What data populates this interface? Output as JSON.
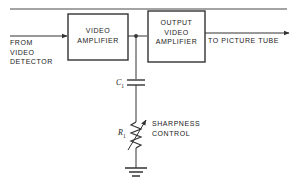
{
  "diagram": {
    "colors": {
      "line": "#333333",
      "text": "#1a1a1a",
      "background": "#ffffff"
    },
    "blocks": [
      {
        "id": "video-amplifier",
        "label": "VIDEO\nAMPLIFIER"
      },
      {
        "id": "output-video-amplifier",
        "label": "OUTPUT\nVIDEO\nAMPLIFIER"
      }
    ],
    "labels": {
      "input": "FROM\nVIDEO\nDETECTOR",
      "output": "TO PICTURE TUBE",
      "control": "SHARPNESS\nCONTROL"
    },
    "components": [
      {
        "id": "capacitor",
        "designator": "C",
        "subscript": "1",
        "type": "capacitor"
      },
      {
        "id": "variable-resistor",
        "designator": "R",
        "subscript": "1",
        "type": "potentiometer"
      },
      {
        "id": "ground",
        "designator": "",
        "subscript": "",
        "type": "ground"
      }
    ]
  }
}
